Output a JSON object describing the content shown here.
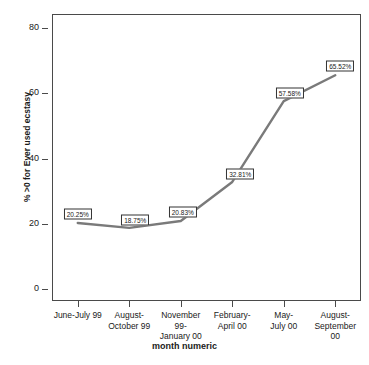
{
  "chart_data": {
    "type": "line",
    "title": "",
    "xlabel": "month numeric",
    "ylabel": "% >0 for Ever used ecstasy",
    "ylim": [
      0,
      85
    ],
    "yticks": [
      0,
      20,
      40,
      60,
      80
    ],
    "ytick_labels": [
      "0",
      "20",
      "40",
      "60",
      "80"
    ],
    "grid": false,
    "legend": "none",
    "categories": [
      "June-July 99",
      "August-\nOctober 99",
      "November 99-\nJanuary 00",
      "February-\nApril 00",
      "May-\nJuly 00",
      "August-\nSeptember\n00"
    ],
    "values": [
      20.25,
      18.75,
      20.83,
      32.81,
      57.58,
      65.52
    ],
    "point_labels": [
      "20.25%",
      "18.75%",
      "20.83%",
      "32.81%",
      "57.58%",
      "65.52%"
    ],
    "line_color": "#7a7a7a",
    "frame_color": "#4a4a4a",
    "label_box_border": "#333333",
    "label_box_fill": "#ffffff"
  }
}
